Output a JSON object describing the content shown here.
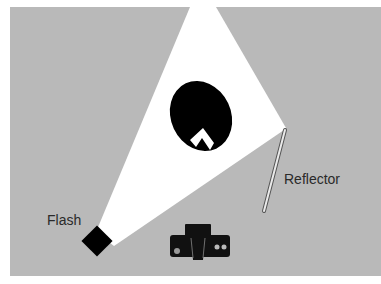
{
  "diagram": {
    "title": "",
    "background_color": "#b9b9b9",
    "light_color": "#ffffff",
    "object_color": "#000000",
    "labels": {
      "flash": "Flash",
      "reflector": "Reflector"
    },
    "elements": [
      {
        "id": "flash",
        "type": "light-source",
        "label": "Flash"
      },
      {
        "id": "light-cone",
        "type": "light-beam"
      },
      {
        "id": "subject",
        "type": "subject-head"
      },
      {
        "id": "reflector",
        "type": "reflector",
        "label": "Reflector"
      },
      {
        "id": "camera",
        "type": "camera"
      }
    ]
  }
}
